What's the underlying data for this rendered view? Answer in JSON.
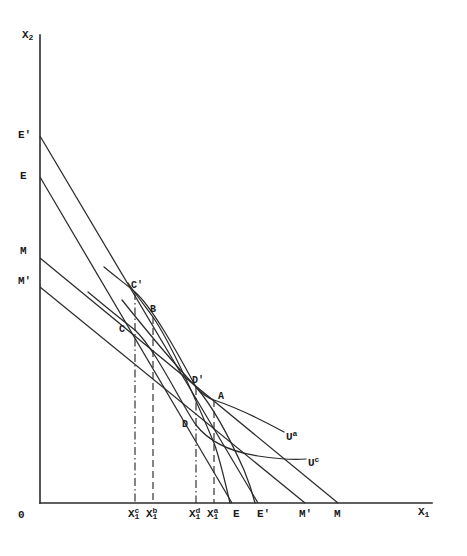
{
  "figure": {
    "type": "economics-indifference-curve-diagram",
    "background_color": "#ffffff",
    "line_color": "#2b2b2b",
    "axes": {
      "y_axis_label": "X",
      "y_axis_label_sub": "2",
      "x_axis_label": "X",
      "x_axis_label_sub": "1",
      "origin_label": "0"
    },
    "y_axis_intercept_labels": [
      {
        "text": "E'",
        "value_y": 136
      },
      {
        "text": "E",
        "value_y": 177
      },
      {
        "text": "M",
        "value_y": 258
      },
      {
        "text": "M'",
        "value_y": 287
      }
    ],
    "x_axis_intercept_labels": [
      {
        "text": "E",
        "value_x": 232
      },
      {
        "text": "E'",
        "value_x": 258
      },
      {
        "text": "M'",
        "value_x": 305
      },
      {
        "text": "M",
        "value_x": 338
      }
    ],
    "x_axis_tick_labels": [
      {
        "base": "X",
        "sub": "1",
        "sup": "c",
        "value_x": 135
      },
      {
        "base": "X",
        "sub": "1",
        "sup": "b",
        "value_x": 153
      },
      {
        "base": "X",
        "sub": "1",
        "sup": "d",
        "value_x": 196
      },
      {
        "base": "X",
        "sub": "1",
        "sup": "a",
        "value_x": 214
      }
    ],
    "equilibrium_points": [
      {
        "text": "C'",
        "x": 135,
        "y": 292
      },
      {
        "text": "B",
        "x": 153,
        "y": 317
      },
      {
        "text": "C",
        "x": 135,
        "y": 330
      },
      {
        "text": "D'",
        "x": 196,
        "y": 387
      },
      {
        "text": "A",
        "x": 214,
        "y": 400
      },
      {
        "text": "D",
        "x": 196,
        "y": 425
      }
    ],
    "curve_labels": [
      {
        "base": "U",
        "sup": "a",
        "x": 288,
        "y": 436
      },
      {
        "base": "U",
        "sup": "c",
        "x": 310,
        "y": 462
      }
    ]
  }
}
